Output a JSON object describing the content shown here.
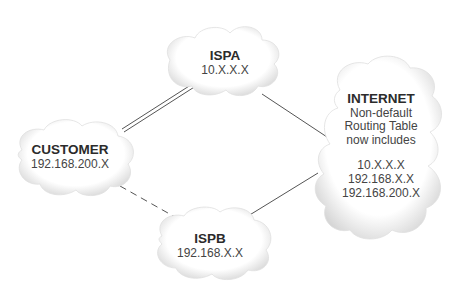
{
  "diagram": {
    "nodes": {
      "ispa": {
        "title": "ISPA",
        "address": "10.X.X.X"
      },
      "customer": {
        "title": "CUSTOMER",
        "address": "192.168.200.X"
      },
      "ispb": {
        "title": "ISPB",
        "address": "192.168.X.X"
      },
      "internet": {
        "title": "INTERNET",
        "description": [
          "Non-default",
          "Routing Table",
          "now includes"
        ],
        "routes": [
          "10.X.X.X",
          "192.168.X.X",
          "192.168.200.X"
        ]
      }
    },
    "edges": [
      {
        "from": "customer",
        "to": "ispa",
        "style": "double"
      },
      {
        "from": "ispa",
        "to": "internet",
        "style": "solid"
      },
      {
        "from": "customer",
        "to": "ispb",
        "style": "dashed"
      },
      {
        "from": "ispb",
        "to": "internet",
        "style": "solid"
      }
    ],
    "colors": {
      "line": "#555555",
      "cloud_fill": "#ffffff",
      "cloud_shade": "#d8d8d8",
      "rule": "#8a8a8a"
    }
  }
}
